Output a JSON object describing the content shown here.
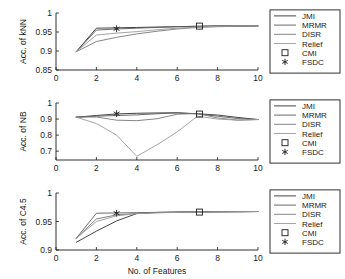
{
  "figure": {
    "xlabel": "No. of Features",
    "xticks": [
      "0",
      "2",
      "4",
      "6",
      "8",
      "10"
    ],
    "legend_entries": [
      {
        "label": "JMI",
        "kind": "line",
        "color": "#303030"
      },
      {
        "label": "MRMR",
        "kind": "line",
        "color": "#5a5a5a"
      },
      {
        "label": "DISR",
        "kind": "line",
        "color": "#787878"
      },
      {
        "label": "Relief",
        "kind": "line",
        "color": "#9a9a9a"
      },
      {
        "label": "CMI",
        "kind": "square",
        "color": "#1a1a1a"
      },
      {
        "label": "FSDC",
        "kind": "star",
        "color": "#1a1a1a"
      }
    ]
  },
  "chart_data": [
    {
      "type": "line",
      "id": "knn",
      "title": "",
      "xlabel": "",
      "ylabel": "Acc. of kNN",
      "xlim": [
        0,
        10
      ],
      "ylim": [
        0.85,
        1
      ],
      "xticks": [
        0,
        2,
        4,
        6,
        8,
        10
      ],
      "yticks": [
        0.85,
        0.9,
        0.95,
        1
      ],
      "ytick_labels": [
        "0.85",
        "0.9",
        "0.95",
        "1"
      ],
      "grid": false,
      "legend_position": "outside-right",
      "x": [
        1,
        2,
        3,
        4,
        5,
        6,
        7,
        8,
        9,
        10
      ],
      "series": [
        {
          "name": "JMI",
          "color": "#303030",
          "values": [
            0.898,
            0.96,
            0.961,
            0.962,
            0.963,
            0.964,
            0.965,
            0.966,
            0.966,
            0.966
          ]
        },
        {
          "name": "MRMR",
          "color": "#5a5a5a",
          "values": [
            0.898,
            0.955,
            0.958,
            0.96,
            0.962,
            0.964,
            0.965,
            0.966,
            0.966,
            0.966
          ]
        },
        {
          "name": "DISR",
          "color": "#787878",
          "values": [
            0.898,
            0.925,
            0.936,
            0.945,
            0.952,
            0.958,
            0.962,
            0.964,
            0.965,
            0.966
          ]
        },
        {
          "name": "Relief",
          "color": "#9a9a9a",
          "values": [
            0.898,
            0.942,
            0.947,
            0.951,
            0.956,
            0.96,
            0.963,
            0.965,
            0.966,
            0.966
          ]
        }
      ],
      "markers": [
        {
          "name": "CMI",
          "shape": "square",
          "x": 7.1,
          "y": 0.9655
        },
        {
          "name": "FSDC",
          "shape": "star",
          "x": 3.0,
          "y": 0.9585
        }
      ]
    },
    {
      "type": "line",
      "id": "nb",
      "title": "",
      "xlabel": "",
      "ylabel": "Acc. of NB",
      "xlim": [
        0,
        10
      ],
      "ylim": [
        0.645,
        1
      ],
      "xticks": [
        0,
        2,
        4,
        6,
        8,
        10
      ],
      "yticks": [
        0.7,
        0.8,
        0.9,
        1
      ],
      "ytick_labels": [
        "0.7",
        "0.8",
        "0.9",
        "1"
      ],
      "grid": false,
      "legend_position": "outside-right",
      "x": [
        1,
        2,
        3,
        4,
        5,
        6,
        7,
        8,
        9,
        10
      ],
      "series": [
        {
          "name": "JMI",
          "color": "#303030",
          "values": [
            0.912,
            0.922,
            0.932,
            0.936,
            0.938,
            0.939,
            0.933,
            0.925,
            0.91,
            0.897
          ]
        },
        {
          "name": "MRMR",
          "color": "#5a5a5a",
          "values": [
            0.912,
            0.918,
            0.922,
            0.926,
            0.933,
            0.938,
            0.932,
            0.918,
            0.903,
            0.897
          ]
        },
        {
          "name": "DISR",
          "color": "#787878",
          "values": [
            0.912,
            0.913,
            0.893,
            0.89,
            0.902,
            0.93,
            0.935,
            0.907,
            0.893,
            0.897
          ]
        },
        {
          "name": "Relief",
          "color": "#9a9a9a",
          "values": [
            0.912,
            0.872,
            0.8,
            0.668,
            0.74,
            0.82,
            0.918,
            0.9,
            0.893,
            0.897
          ]
        }
      ],
      "markers": [
        {
          "name": "CMI",
          "shape": "square",
          "x": 7.1,
          "y": 0.931
        },
        {
          "name": "FSDC",
          "shape": "star",
          "x": 3.0,
          "y": 0.934
        }
      ]
    },
    {
      "type": "line",
      "id": "c45",
      "title": "",
      "xlabel": "No. of Features",
      "ylabel": "Acc. of C4.5",
      "xlim": [
        0,
        10
      ],
      "ylim": [
        0.9,
        1
      ],
      "xticks": [
        0,
        2,
        4,
        6,
        8,
        10
      ],
      "yticks": [
        0.9,
        0.95,
        1
      ],
      "ytick_labels": [
        "0.9",
        "0.95",
        "1"
      ],
      "grid": false,
      "legend_position": "outside-right",
      "x": [
        1,
        2,
        3,
        4,
        5,
        6,
        7,
        8,
        9,
        10
      ],
      "series": [
        {
          "name": "JMI",
          "color": "#303030",
          "values": [
            0.9135,
            0.933,
            0.951,
            0.964,
            0.966,
            0.9665,
            0.9668,
            0.967,
            0.9672,
            0.9675
          ]
        },
        {
          "name": "MRMR",
          "color": "#5a5a5a",
          "values": [
            0.9205,
            0.9645,
            0.965,
            0.9655,
            0.966,
            0.9665,
            0.9668,
            0.967,
            0.9672,
            0.9675
          ]
        },
        {
          "name": "DISR",
          "color": "#787878",
          "values": [
            0.9205,
            0.9545,
            0.9615,
            0.964,
            0.9655,
            0.9662,
            0.9666,
            0.967,
            0.9672,
            0.9675
          ]
        },
        {
          "name": "Relief",
          "color": "#9a9a9a",
          "values": [
            0.9205,
            0.95,
            0.96,
            0.9638,
            0.9652,
            0.966,
            0.9665,
            0.9668,
            0.9672,
            0.9675
          ]
        }
      ],
      "markers": [
        {
          "name": "CMI",
          "shape": "square",
          "x": 7.1,
          "y": 0.9665
        },
        {
          "name": "FSDC",
          "shape": "star",
          "x": 3.0,
          "y": 0.9645
        }
      ]
    }
  ]
}
